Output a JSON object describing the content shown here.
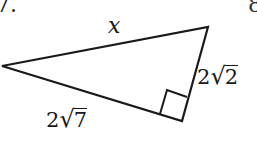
{
  "problem": {
    "number": "7.",
    "next_number_partial": "8"
  },
  "diagram": {
    "shape": "right-triangle",
    "vertices": {
      "left": [
        2,
        66
      ],
      "top_right": [
        208,
        27
      ],
      "bottom_right_angle": [
        182,
        121
      ]
    },
    "right_angle_marker": [
      [
        160,
        114
      ],
      [
        167,
        90
      ],
      [
        187,
        97
      ]
    ],
    "stroke_color": "#1a1a1a",
    "labels": {
      "hypotenuse": "x",
      "right_leg": {
        "coefficient": "2",
        "radicand": "2"
      },
      "bottom_leg": {
        "coefficient": "2",
        "radicand": "7"
      }
    }
  }
}
